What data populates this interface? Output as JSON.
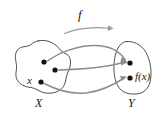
{
  "diagram": {
    "type": "function-mapping-diagram",
    "function_label": "f",
    "sets": [
      {
        "id": "X",
        "name": "X",
        "label": "X",
        "role": "domain",
        "label_position": {
          "x": 40,
          "y": 105
        },
        "shape": "irregular-blob",
        "outline_color": "#3a3a3a"
      },
      {
        "id": "Y",
        "name": "Y",
        "label": "Y",
        "role": "codomain",
        "label_position": {
          "x": 133,
          "y": 105
        },
        "shape": "rounded-dome-blob",
        "outline_color": "#3a3a3a"
      }
    ],
    "points": [
      {
        "id": "x1",
        "set": "X",
        "label": "",
        "x": 44,
        "y": 62,
        "color": "#131313",
        "radius": 2.6
      },
      {
        "id": "x2",
        "set": "X",
        "label": "",
        "x": 55,
        "y": 70,
        "color": "#131313",
        "radius": 2.6
      },
      {
        "id": "x3",
        "set": "X",
        "label": "x",
        "x": 41,
        "y": 82,
        "color": "#131313",
        "radius": 2.6
      },
      {
        "id": "y1",
        "set": "Y",
        "label": "",
        "x": 130,
        "y": 63,
        "color": "#131313",
        "radius": 2.6
      },
      {
        "id": "y2",
        "set": "Y",
        "label": "f(x)",
        "x": 130,
        "y": 78,
        "color": "#131313",
        "radius": 2.6
      }
    ],
    "element_labels": [
      {
        "id": "label-x",
        "text": "x",
        "for_point": "x3",
        "style": "italic"
      },
      {
        "id": "label-fx",
        "text": "f(x)",
        "for_point": "y2",
        "style": "italic"
      }
    ],
    "arrows": [
      {
        "id": "arrow-1",
        "from": "x1",
        "to": "y1",
        "curve": "arc-up",
        "color": "#8d8d8d"
      },
      {
        "id": "arrow-2",
        "from": "x2",
        "to": "y1",
        "curve": "arc-slight-up",
        "color": "#8d8d8d"
      },
      {
        "id": "arrow-3",
        "from": "x3",
        "to": "y2",
        "curve": "arc-down",
        "color": "#8d8d8d"
      }
    ],
    "function_arrow": {
      "id": "f-arrow",
      "label": "f",
      "direction": "left-to-right",
      "curve": "shallow-arc",
      "color": "#9a9a9a"
    },
    "colors": {
      "background": "#ffffff",
      "outline": "#3a3a3a",
      "arrow": "#8d8d8d",
      "label_arrow": "#9a9a9a",
      "dot": "#131313",
      "text": "#1a1a1a"
    }
  }
}
